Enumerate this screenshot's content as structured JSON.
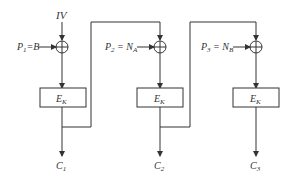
{
  "diagram": {
    "type": "CBC mode encryption",
    "iv_label": "IV",
    "blocks": [
      {
        "plaintext": {
          "main": "P",
          "sub": "1",
          "eq": "=",
          "value": "B",
          "value_sub": ""
        },
        "cipher": {
          "main": "E",
          "sub": "K"
        },
        "output": {
          "main": "C",
          "sub": "1"
        }
      },
      {
        "plaintext": {
          "main": "P",
          "sub": "2",
          "eq": " = ",
          "value": "N",
          "value_sub": "A"
        },
        "cipher": {
          "main": "E",
          "sub": "K"
        },
        "output": {
          "main": "C",
          "sub": "2"
        }
      },
      {
        "plaintext": {
          "main": "P",
          "sub": "3",
          "eq": " = ",
          "value": "N",
          "value_sub": "B"
        },
        "cipher": {
          "main": "E",
          "sub": "K"
        },
        "output": {
          "main": "C",
          "sub": "3"
        }
      }
    ],
    "colors": {
      "line": "#333333",
      "background": "#ffffff"
    }
  }
}
